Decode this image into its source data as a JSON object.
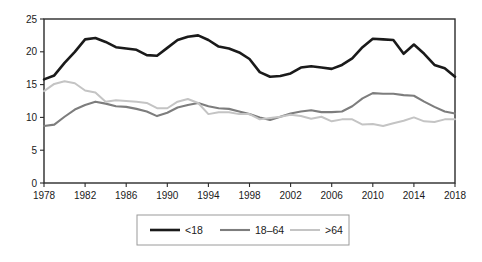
{
  "chart_data": {
    "type": "line",
    "title": "",
    "subtitle": "",
    "xlabel": "",
    "ylabel": "",
    "x": [
      1978,
      1979,
      1980,
      1981,
      1982,
      1983,
      1984,
      1985,
      1986,
      1987,
      1988,
      1989,
      1990,
      1991,
      1992,
      1993,
      1994,
      1995,
      1996,
      1997,
      1998,
      1999,
      2000,
      2001,
      2002,
      2003,
      2004,
      2005,
      2006,
      2007,
      2008,
      2009,
      2010,
      2011,
      2012,
      2013,
      2014,
      2015,
      2016,
      2017,
      2018
    ],
    "xlim": [
      1978,
      2018
    ],
    "ylim": [
      0,
      25
    ],
    "xticks": [
      1978,
      1982,
      1986,
      1990,
      1994,
      1998,
      2002,
      2006,
      2010,
      2014,
      2018
    ],
    "xticklabels": [
      "1978",
      "1982",
      "1986",
      "1990",
      "1994",
      "1998",
      "2002",
      "2006",
      "2010",
      "2014",
      "2018"
    ],
    "yticks": [
      0,
      5,
      10,
      15,
      20,
      25
    ],
    "yticklabels": [
      "0",
      "5",
      "10",
      "15",
      "20",
      "25"
    ],
    "grid": false,
    "legend_position": "bottom",
    "series": [
      {
        "name": "<18",
        "color": "#1a1a1a",
        "width": 2.6,
        "values": [
          15.8,
          16.4,
          18.3,
          20.0,
          21.9,
          22.1,
          21.5,
          20.7,
          20.5,
          20.3,
          19.5,
          19.4,
          20.6,
          21.8,
          22.3,
          22.5,
          21.8,
          20.8,
          20.5,
          19.9,
          18.9,
          16.9,
          16.2,
          16.3,
          16.7,
          17.6,
          17.8,
          17.6,
          17.4,
          18.0,
          19.0,
          20.7,
          22.0,
          21.9,
          21.8,
          19.7,
          21.1,
          19.7,
          18.0,
          17.5,
          16.2
        ]
      },
      {
        "name": "18–64",
        "color": "#7d7d7d",
        "width": 2.1,
        "values": [
          8.7,
          8.9,
          10.1,
          11.2,
          11.9,
          12.4,
          12.1,
          11.7,
          11.6,
          11.3,
          10.9,
          10.2,
          10.7,
          11.5,
          11.9,
          12.2,
          11.7,
          11.4,
          11.3,
          10.9,
          10.5,
          10.0,
          9.6,
          10.1,
          10.6,
          10.9,
          11.1,
          10.8,
          10.8,
          10.9,
          11.7,
          12.9,
          13.7,
          13.6,
          13.6,
          13.4,
          13.3,
          12.4,
          11.6,
          10.9,
          10.6
        ]
      },
      {
        "name": ">64",
        "color": "#c4c4c4",
        "width": 2.0,
        "values": [
          14.0,
          15.1,
          15.5,
          15.2,
          14.1,
          13.8,
          12.4,
          12.6,
          12.5,
          12.4,
          12.2,
          11.4,
          11.4,
          12.4,
          12.8,
          12.2,
          10.5,
          10.8,
          10.8,
          10.5,
          10.5,
          9.7,
          9.9,
          10.1,
          10.4,
          10.2,
          9.8,
          10.1,
          9.4,
          9.7,
          9.7,
          8.9,
          9.0,
          8.7,
          9.1,
          9.5,
          10.0,
          9.4,
          9.3,
          9.7,
          9.7
        ]
      }
    ]
  },
  "legend": {
    "items": [
      {
        "label": "<18"
      },
      {
        "label": "18–64"
      },
      {
        "label": ">64"
      }
    ]
  }
}
